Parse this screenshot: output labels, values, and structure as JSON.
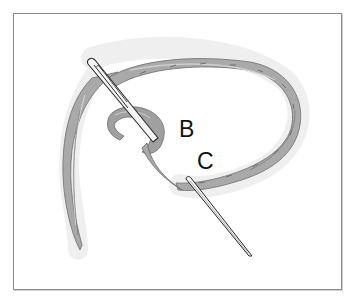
{
  "figure": {
    "labels": {
      "b": "B",
      "c": "C"
    },
    "colors": {
      "frame_border": "#8a8a8a",
      "thread_fill": "#a9a9a9",
      "thread_shadow": "#7d7d7d",
      "thread_highlight": "#cfcfcf",
      "halo": "#eeeeee",
      "needle_fill": "#f4f4f4",
      "needle_outline": "#2a2a2a",
      "label_text": "#111111"
    }
  }
}
